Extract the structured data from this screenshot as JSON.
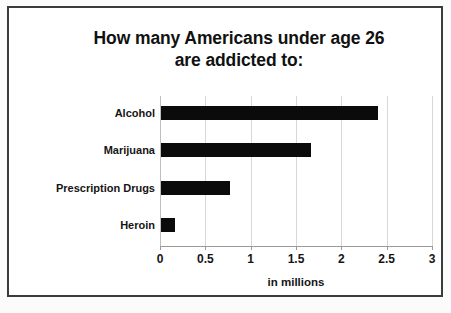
{
  "chart_data": {
    "type": "bar",
    "orientation": "horizontal",
    "title": "How many Americans under age 26 are addicted to:",
    "title_line1": "How many Americans under age 26",
    "title_line2": "are addicted to:",
    "categories": [
      "Alcohol",
      "Marijuana",
      "Prescription Drugs",
      "Heroin"
    ],
    "values": [
      2.4,
      1.67,
      0.77,
      0.16
    ],
    "xlabel": "in millions",
    "ylabel": "",
    "xlim": [
      0,
      3
    ],
    "xticks": [
      "0",
      "0.5",
      "1",
      "1.5",
      "2",
      "2.5",
      "3"
    ],
    "xtick_values": [
      0,
      0.5,
      1,
      1.5,
      2,
      2.5,
      3
    ],
    "grid": "vertical",
    "legend": "none",
    "bar_color": "#0b0b0b",
    "background_color": "#ffffff",
    "gridline_color": "#d8d8d8"
  }
}
